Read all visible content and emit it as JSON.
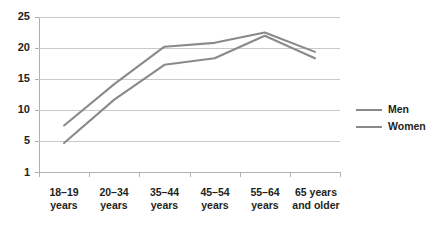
{
  "chart_data": {
    "type": "line",
    "title": "",
    "subtitle": "",
    "xlabel": "",
    "ylabel": "",
    "categories": [
      "18–19 years",
      "20–34 years",
      "35–44 years",
      "45–54 years",
      "55–64 years",
      "65 years and older"
    ],
    "series": [
      {
        "name": "Men",
        "values": [
          8.2,
          14.6,
          20.4,
          21.0,
          22.6,
          19.6
        ]
      },
      {
        "name": "Women",
        "values": [
          5.5,
          12.2,
          17.6,
          18.6,
          22.1,
          18.6
        ]
      }
    ],
    "ylim": [
      1,
      25
    ],
    "yticks": [
      1,
      5,
      10,
      15,
      20,
      25
    ],
    "ytick_labels": [
      "1",
      "5",
      "10",
      "15",
      "20",
      "25"
    ],
    "grid": true,
    "gridlines_at": [
      5,
      10,
      15,
      20,
      25
    ],
    "legend_position": "right",
    "colors": {
      "men_line": "#8a8a8a",
      "women_line": "#8a8a8a",
      "gridline": "#c9c9c9",
      "axis": "#b0b0b0",
      "text": "#231f20",
      "background": "#ffffff"
    }
  },
  "legend": {
    "entries": [
      {
        "label": "Men"
      },
      {
        "label": "Women"
      }
    ]
  },
  "axes": {
    "y": {
      "tick_labels": [
        "25",
        "20",
        "15",
        "10",
        "5",
        "1"
      ]
    },
    "x": {
      "tick_labels": [
        {
          "line1": "18–19",
          "line2": "years"
        },
        {
          "line1": "20–34",
          "line2": "years"
        },
        {
          "line1": "35–44",
          "line2": "years"
        },
        {
          "line1": "45–54",
          "line2": "years"
        },
        {
          "line1": "55–64",
          "line2": "years"
        },
        {
          "line1": "65 years",
          "line2": "and older"
        }
      ]
    }
  }
}
